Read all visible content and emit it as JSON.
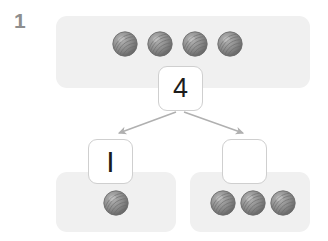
{
  "worksheet": {
    "problem_number": "1",
    "type": "number-bond-part-part-whole",
    "colors": {
      "panel_fill": "#f0f0f0",
      "box_fill": "#ffffff",
      "box_border": "#cfcfcf",
      "arrow": "#b0b0b0",
      "counter_gray": "#8b8b8b",
      "counter_dark": "#5f5f5f",
      "number_text": "#1c1c1c",
      "problem_number_text": "#8e8e8e",
      "background": "#ffffff"
    }
  },
  "whole": {
    "box_value": "4",
    "box_empty": false,
    "counter_count": 4,
    "counter_label": "counter",
    "counters": [
      {
        "id": "whole-counter-1"
      },
      {
        "id": "whole-counter-2"
      },
      {
        "id": "whole-counter-3"
      },
      {
        "id": "whole-counter-4"
      }
    ]
  },
  "parts": [
    {
      "name": "part-left",
      "box_value": "I",
      "box_empty": false,
      "counter_count": 1,
      "counters": [
        {
          "id": "part-left-counter-1"
        }
      ]
    },
    {
      "name": "part-right",
      "box_value": "",
      "box_empty": true,
      "counter_count": 3,
      "counters": [
        {
          "id": "part-right-counter-1"
        },
        {
          "id": "part-right-counter-2"
        },
        {
          "id": "part-right-counter-3"
        }
      ]
    }
  ],
  "arrows": [
    {
      "name": "arrow-to-left-part",
      "direction": "down-left"
    },
    {
      "name": "arrow-to-right-part",
      "direction": "down-right"
    }
  ]
}
